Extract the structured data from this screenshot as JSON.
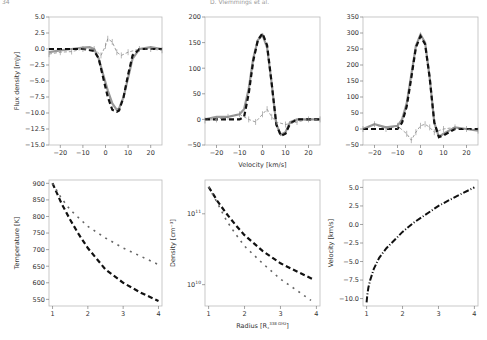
{
  "header": {
    "page_number": "34",
    "running_title": "D. Vlemmings et al."
  },
  "chart_data": [
    {
      "type": "line",
      "panel": "top-left",
      "title": "",
      "xlabel": "",
      "ylabel": "Flux density [mJy]",
      "xlim": [
        -25,
        25
      ],
      "ylim": [
        -15.0,
        5.0
      ],
      "xticks": [
        "-20",
        "-10",
        "0",
        "10",
        "20"
      ],
      "yticks": [
        "5.0",
        "2.5",
        "0.0",
        "-2.5",
        "-5.0",
        "-7.5",
        "-10.0",
        "-12.5",
        "-15.0"
      ],
      "series": [
        {
          "name": "observed",
          "style": "grey solid",
          "x": [
            -25,
            -20,
            -15,
            -10,
            -7,
            -5,
            -3,
            -1,
            1,
            3,
            5,
            6,
            8,
            10,
            12,
            15,
            20,
            25
          ],
          "y": [
            -0.5,
            -0.2,
            0.0,
            0.2,
            0.3,
            0.0,
            -1.5,
            -4.0,
            -6.5,
            -8.5,
            -9.5,
            -9.3,
            -7.5,
            -4.5,
            -1.5,
            0.0,
            0.3,
            0.0
          ]
        },
        {
          "name": "model",
          "style": "black dashed",
          "x": [
            -25,
            -20,
            -15,
            -10,
            -5,
            -3,
            -1,
            1,
            3,
            5,
            6,
            8,
            10,
            12,
            15,
            20,
            25
          ],
          "y": [
            0,
            0,
            0,
            0,
            -0.3,
            -1.5,
            -4.5,
            -7.5,
            -9.5,
            -9.8,
            -9.6,
            -7.5,
            -4.0,
            -1.0,
            0,
            0,
            0
          ]
        },
        {
          "name": "residual",
          "style": "grey dashed with errorbars",
          "x": [
            -25,
            -20,
            -15,
            -10,
            -5,
            -2,
            0,
            1,
            3,
            5,
            7,
            10,
            15,
            20,
            25
          ],
          "y": [
            -0.8,
            -0.5,
            -0.4,
            0.0,
            0.0,
            -1.0,
            0.5,
            1.6,
            1.1,
            -0.5,
            -1.0,
            -0.5,
            0.0,
            0.0,
            -0.2
          ]
        }
      ]
    },
    {
      "type": "line",
      "panel": "top-middle",
      "xlabel": "Velocity [km/s]",
      "ylabel": "",
      "xlim": [
        -25,
        25
      ],
      "ylim": [
        -50,
        200
      ],
      "xticks": [
        "-20",
        "-10",
        "0",
        "10",
        "20"
      ],
      "yticks": [
        "200",
        "150",
        "100",
        "50",
        "0",
        "-50"
      ],
      "series": [
        {
          "name": "observed",
          "style": "grey solid",
          "x": [
            -25,
            -20,
            -15,
            -10,
            -8,
            -6,
            -4,
            -2,
            0,
            2,
            4,
            6,
            8,
            10,
            12,
            15,
            20,
            25
          ],
          "y": [
            0,
            5,
            5,
            10,
            20,
            60,
            120,
            155,
            165,
            140,
            70,
            -10,
            -30,
            -25,
            -5,
            0,
            0,
            0
          ]
        },
        {
          "name": "model",
          "style": "black dashed",
          "x": [
            -25,
            -10,
            -8,
            -6,
            -4,
            -2,
            0,
            2,
            4,
            6,
            8,
            10,
            12,
            15,
            25
          ],
          "y": [
            0,
            0,
            5,
            50,
            115,
            155,
            168,
            145,
            70,
            -10,
            -32,
            -28,
            -8,
            0,
            0
          ]
        },
        {
          "name": "residual",
          "style": "grey dashed with errorbars",
          "x": [
            -25,
            -20,
            -15,
            -10,
            -6,
            -3,
            0,
            2,
            4,
            6,
            10,
            15,
            20,
            25
          ],
          "y": [
            -2,
            0,
            5,
            10,
            0,
            -5,
            10,
            20,
            5,
            -5,
            -10,
            -5,
            0,
            0
          ]
        }
      ]
    },
    {
      "type": "line",
      "panel": "top-right",
      "xlabel": "",
      "ylabel": "",
      "xlim": [
        -25,
        25
      ],
      "ylim": [
        -50,
        350
      ],
      "xticks": [
        "-20",
        "-10",
        "0",
        "10",
        "20"
      ],
      "yticks": [
        "350",
        "300",
        "250",
        "200",
        "150",
        "100",
        "50",
        "0",
        "-50"
      ],
      "series": [
        {
          "name": "observed",
          "style": "grey solid",
          "x": [
            -25,
            -20,
            -15,
            -10,
            -8,
            -6,
            -4,
            -2,
            0,
            2,
            4,
            6,
            8,
            10,
            15,
            20,
            25
          ],
          "y": [
            0,
            15,
            5,
            10,
            30,
            80,
            170,
            260,
            295,
            270,
            160,
            20,
            -25,
            -15,
            5,
            0,
            -5
          ]
        },
        {
          "name": "model",
          "style": "black dashed",
          "x": [
            -25,
            -10,
            -8,
            -6,
            -4,
            -2,
            0,
            2,
            4,
            6,
            8,
            10,
            15,
            25
          ],
          "y": [
            0,
            0,
            20,
            70,
            160,
            255,
            290,
            265,
            160,
            20,
            -25,
            -20,
            0,
            0
          ]
        },
        {
          "name": "residual",
          "style": "grey dashed with errorbars",
          "x": [
            -25,
            -20,
            -15,
            -10,
            -6,
            -4,
            -2,
            0,
            2,
            4,
            6,
            10,
            15,
            20,
            25
          ],
          "y": [
            0,
            15,
            0,
            10,
            -15,
            -35,
            -10,
            10,
            15,
            5,
            -10,
            0,
            5,
            0,
            -5
          ]
        }
      ]
    },
    {
      "type": "line",
      "panel": "bottom-left",
      "xlabel": "",
      "ylabel": "Temperature [K]",
      "xlim": [
        0.9,
        4.1
      ],
      "ylim": [
        530,
        910
      ],
      "xticks": [
        "1",
        "2",
        "3",
        "4"
      ],
      "yticks": [
        "900",
        "850",
        "800",
        "750",
        "700",
        "650",
        "600",
        "550"
      ],
      "series": [
        {
          "name": "model A",
          "style": "black dashed",
          "x": [
            1.0,
            1.25,
            1.5,
            1.75,
            2.0,
            2.5,
            3.0,
            3.5,
            4.0
          ],
          "y": [
            900,
            840,
            790,
            745,
            705,
            640,
            600,
            570,
            545
          ]
        },
        {
          "name": "model B",
          "style": "grey dash-dot",
          "x": [
            1.0,
            1.25,
            1.5,
            1.75,
            2.0,
            2.5,
            3.0,
            3.5,
            4.0
          ],
          "y": [
            900,
            855,
            820,
            795,
            770,
            735,
            705,
            680,
            655
          ]
        }
      ]
    },
    {
      "type": "line",
      "panel": "bottom-middle",
      "xlabel": "Radius [R₁³³⁸ ᴳᴴᶻ]",
      "xlabel_text": "Radius [R*^338 GHz]",
      "ylabel": "Density [cm⁻³]",
      "yscale": "log",
      "xlim": [
        0.9,
        4.1
      ],
      "ylim": [
        5000000000.0,
        300000000000.0
      ],
      "xticks": [
        "1",
        "2",
        "3",
        "4"
      ],
      "yticks": [
        "10^11",
        "10^10"
      ],
      "series": [
        {
          "name": "model A",
          "style": "black dashed",
          "x": [
            1.0,
            1.25,
            1.5,
            1.75,
            2.0,
            2.5,
            3.0,
            3.5,
            3.9
          ],
          "y": [
            240000000000.0,
            150000000000.0,
            100000000000.0,
            70000000000.0,
            50000000000.0,
            30000000000.0,
            20000000000.0,
            15000000000.0,
            12000000000.0
          ]
        },
        {
          "name": "model B",
          "style": "grey dash-dot",
          "x": [
            1.0,
            1.25,
            1.5,
            1.75,
            2.0,
            2.5,
            3.0,
            3.5,
            3.85
          ],
          "y": [
            240000000000.0,
            140000000000.0,
            80000000000.0,
            52000000000.0,
            35000000000.0,
            20000000000.0,
            12000000000.0,
            8000000000.0,
            6000000000.0
          ]
        }
      ]
    },
    {
      "type": "line",
      "panel": "bottom-right",
      "xlabel": "",
      "ylabel": "Velocity [km/s]",
      "xlim": [
        0.9,
        4.1
      ],
      "ylim": [
        -11,
        6
      ],
      "xticks": [
        "1",
        "2",
        "3",
        "4"
      ],
      "yticks": [
        "5.0",
        "2.5",
        "0.0",
        "-2.5",
        "-5.0",
        "-7.5",
        "-10.0"
      ],
      "series": [
        {
          "name": "model",
          "style": "black dash-dot",
          "x": [
            1.0,
            1.02,
            1.05,
            1.1,
            1.2,
            1.35,
            1.55,
            1.8,
            2.0,
            2.3,
            2.6,
            3.0,
            3.5,
            4.0
          ],
          "y": [
            -10.5,
            -9.5,
            -8.5,
            -7.5,
            -6.0,
            -4.5,
            -3.2,
            -2.0,
            -1.0,
            0.2,
            1.2,
            2.5,
            3.8,
            5.0
          ]
        }
      ]
    }
  ]
}
